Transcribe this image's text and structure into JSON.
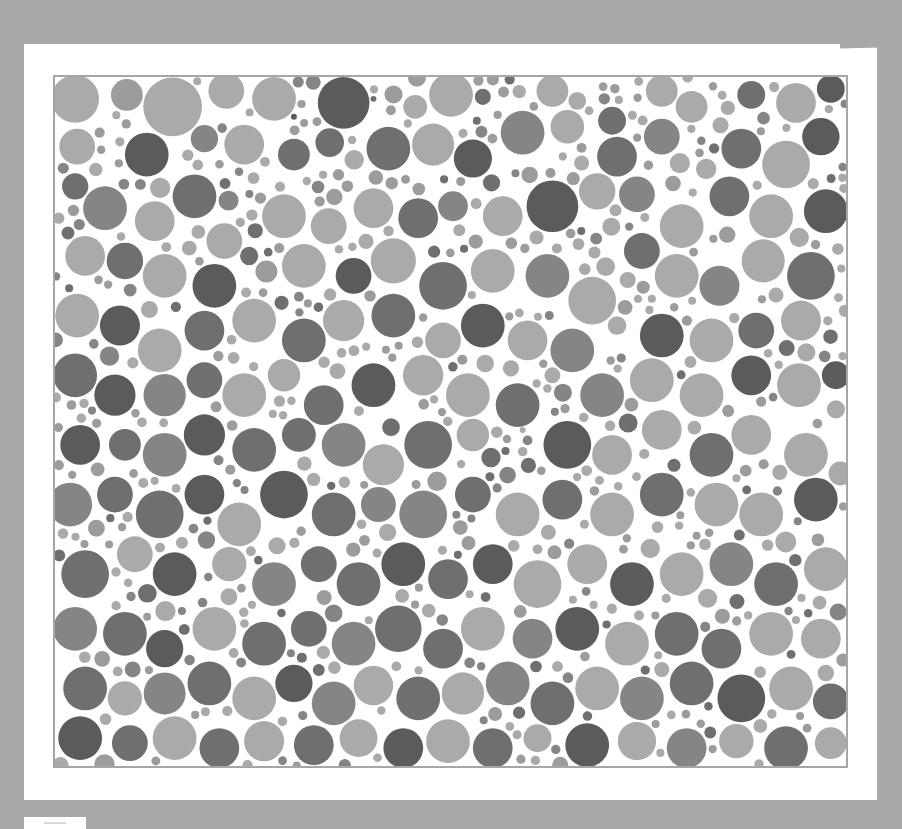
{
  "page": {
    "background_color": "#a9a9a9",
    "card_color": "#ffffff",
    "plate_border_color": "#a6a6a6"
  },
  "plate": {
    "type": "color-vision test plate (pseudo-isochromatic dot pattern, grayscale)",
    "hidden_figure_hint": "darker dot cluster in lower-left/center region",
    "palette": {
      "light": "#aaaaaa",
      "mid_light": "#9c9c9c",
      "mid": "#858585",
      "dark": "#6f6f6f",
      "darkest": "#5b5b5b"
    },
    "width": 795,
    "height": 693,
    "dots": [
      [
        20,
        22,
        24,
        "light"
      ],
      [
        72,
        18,
        16,
        "mid_light"
      ],
      [
        118,
        30,
        30,
        "light"
      ],
      [
        172,
        14,
        18,
        "light"
      ],
      [
        220,
        22,
        22,
        "light"
      ],
      [
        240,
        40,
        20,
        "darkest"
      ],
      [
        290,
        26,
        26,
        "darkest"
      ],
      [
        320,
        22,
        18,
        "dark"
      ],
      [
        362,
        30,
        12,
        "light"
      ],
      [
        398,
        18,
        22,
        "light"
      ],
      [
        430,
        20,
        16,
        "dark"
      ],
      [
        500,
        14,
        16,
        "light"
      ],
      [
        525,
        24,
        22,
        "light"
      ],
      [
        560,
        44,
        14,
        "dark"
      ],
      [
        610,
        14,
        16,
        "light"
      ],
      [
        640,
        30,
        26,
        "light"
      ],
      [
        700,
        18,
        14,
        "dark"
      ],
      [
        745,
        26,
        20,
        "light"
      ],
      [
        780,
        12,
        14,
        "darkest"
      ],
      [
        22,
        70,
        18,
        "light"
      ],
      [
        92,
        78,
        22,
        "darkest"
      ],
      [
        150,
        62,
        22,
        "mid"
      ],
      [
        190,
        68,
        20,
        "light"
      ],
      [
        240,
        78,
        16,
        "dark"
      ],
      [
        276,
        66,
        20,
        "dark"
      ],
      [
        335,
        72,
        22,
        "dark"
      ],
      [
        380,
        68,
        24,
        "light"
      ],
      [
        420,
        82,
        24,
        "darkest"
      ],
      [
        470,
        56,
        22,
        "mid"
      ],
      [
        515,
        50,
        22,
        "light"
      ],
      [
        565,
        80,
        20,
        "dark"
      ],
      [
        610,
        60,
        18,
        "mid"
      ],
      [
        690,
        72,
        20,
        "dark"
      ],
      [
        735,
        88,
        24,
        "light"
      ],
      [
        770,
        60,
        20,
        "darkest"
      ],
      [
        50,
        132,
        22,
        "mid"
      ],
      [
        20,
        110,
        16,
        "dark"
      ],
      [
        100,
        145,
        20,
        "light"
      ],
      [
        140,
        120,
        22,
        "dark"
      ],
      [
        170,
        165,
        18,
        "light"
      ],
      [
        230,
        140,
        22,
        "light"
      ],
      [
        275,
        150,
        18,
        "light"
      ],
      [
        320,
        132,
        20,
        "light"
      ],
      [
        365,
        142,
        20,
        "dark"
      ],
      [
        400,
        130,
        18,
        "mid"
      ],
      [
        450,
        140,
        20,
        "light"
      ],
      [
        500,
        130,
        26,
        "darkest"
      ],
      [
        545,
        115,
        22,
        "light"
      ],
      [
        585,
        118,
        18,
        "mid"
      ],
      [
        630,
        150,
        22,
        "light"
      ],
      [
        678,
        120,
        20,
        "dark"
      ],
      [
        720,
        140,
        22,
        "light"
      ],
      [
        775,
        135,
        22,
        "darkest"
      ],
      [
        30,
        180,
        20,
        "light"
      ],
      [
        70,
        185,
        20,
        "dark"
      ],
      [
        110,
        200,
        22,
        "light"
      ],
      [
        160,
        210,
        22,
        "darkest"
      ],
      [
        195,
        180,
        16,
        "dark"
      ],
      [
        250,
        190,
        22,
        "light"
      ],
      [
        300,
        200,
        18,
        "darkest"
      ],
      [
        340,
        185,
        24,
        "light"
      ],
      [
        390,
        210,
        24,
        "dark"
      ],
      [
        440,
        195,
        22,
        "light"
      ],
      [
        495,
        200,
        22,
        "mid"
      ],
      [
        540,
        225,
        24,
        "light"
      ],
      [
        590,
        175,
        18,
        "dark"
      ],
      [
        625,
        200,
        22,
        "light"
      ],
      [
        668,
        210,
        22,
        "mid"
      ],
      [
        712,
        185,
        22,
        "light"
      ],
      [
        760,
        200,
        24,
        "dark"
      ],
      [
        22,
        240,
        22,
        "light"
      ],
      [
        65,
        250,
        22,
        "darkest"
      ],
      [
        105,
        275,
        22,
        "light"
      ],
      [
        150,
        255,
        20,
        "dark"
      ],
      [
        200,
        245,
        22,
        "light"
      ],
      [
        250,
        265,
        22,
        "dark"
      ],
      [
        290,
        245,
        22,
        "light"
      ],
      [
        340,
        240,
        22,
        "dark"
      ],
      [
        390,
        265,
        18,
        "light"
      ],
      [
        430,
        250,
        22,
        "darkest"
      ],
      [
        475,
        265,
        20,
        "light"
      ],
      [
        520,
        275,
        22,
        "mid"
      ],
      [
        565,
        250,
        22,
        "light"
      ],
      [
        610,
        260,
        22,
        "darkest"
      ],
      [
        660,
        265,
        22,
        "light"
      ],
      [
        705,
        255,
        18,
        "dark"
      ],
      [
        750,
        245,
        24,
        "light"
      ],
      [
        20,
        300,
        22,
        "dark"
      ],
      [
        60,
        320,
        24,
        "darkest"
      ],
      [
        110,
        320,
        22,
        "mid"
      ],
      [
        150,
        305,
        18,
        "dark"
      ],
      [
        190,
        320,
        22,
        "light"
      ],
      [
        230,
        300,
        20,
        "light"
      ],
      [
        270,
        330,
        20,
        "dark"
      ],
      [
        320,
        310,
        22,
        "darkest"
      ],
      [
        370,
        300,
        22,
        "light"
      ],
      [
        415,
        320,
        22,
        "light"
      ],
      [
        465,
        330,
        22,
        "dark"
      ],
      [
        500,
        300,
        20,
        "light"
      ],
      [
        550,
        320,
        22,
        "mid"
      ],
      [
        600,
        305,
        22,
        "light"
      ],
      [
        650,
        320,
        22,
        "light"
      ],
      [
        700,
        300,
        20,
        "darkest"
      ],
      [
        748,
        310,
        22,
        "light"
      ],
      [
        785,
        300,
        14,
        "darkest"
      ],
      [
        25,
        370,
        20,
        "darkest"
      ],
      [
        70,
        370,
        16,
        "dark"
      ],
      [
        110,
        380,
        22,
        "mid"
      ],
      [
        150,
        360,
        24,
        "darkest"
      ],
      [
        200,
        375,
        22,
        "dark"
      ],
      [
        245,
        360,
        20,
        "dark"
      ],
      [
        290,
        370,
        22,
        "mid"
      ],
      [
        330,
        390,
        22,
        "light"
      ],
      [
        375,
        370,
        24,
        "dark"
      ],
      [
        420,
        360,
        20,
        "light"
      ],
      [
        470,
        355,
        22,
        "light"
      ],
      [
        515,
        370,
        24,
        "darkest"
      ],
      [
        560,
        380,
        20,
        "light"
      ],
      [
        610,
        355,
        20,
        "light"
      ],
      [
        660,
        380,
        22,
        "dark"
      ],
      [
        700,
        360,
        20,
        "light"
      ],
      [
        755,
        380,
        22,
        "light"
      ],
      [
        15,
        430,
        22,
        "mid"
      ],
      [
        60,
        420,
        18,
        "dark"
      ],
      [
        105,
        440,
        24,
        "dark"
      ],
      [
        150,
        420,
        20,
        "darkest"
      ],
      [
        185,
        450,
        22,
        "light"
      ],
      [
        230,
        420,
        24,
        "darkest"
      ],
      [
        280,
        440,
        22,
        "dark"
      ],
      [
        325,
        430,
        22,
        "mid"
      ],
      [
        370,
        440,
        24,
        "mid"
      ],
      [
        420,
        420,
        18,
        "dark"
      ],
      [
        465,
        440,
        22,
        "light"
      ],
      [
        510,
        425,
        20,
        "dark"
      ],
      [
        560,
        440,
        22,
        "light"
      ],
      [
        610,
        420,
        22,
        "dark"
      ],
      [
        665,
        430,
        22,
        "light"
      ],
      [
        710,
        440,
        22,
        "light"
      ],
      [
        765,
        425,
        22,
        "darkest"
      ],
      [
        30,
        500,
        24,
        "dark"
      ],
      [
        80,
        480,
        18,
        "light"
      ],
      [
        120,
        500,
        22,
        "darkest"
      ],
      [
        175,
        490,
        22,
        "light"
      ],
      [
        220,
        510,
        22,
        "mid"
      ],
      [
        265,
        490,
        18,
        "dark"
      ],
      [
        305,
        510,
        22,
        "dark"
      ],
      [
        350,
        490,
        22,
        "darkest"
      ],
      [
        395,
        505,
        20,
        "dark"
      ],
      [
        440,
        490,
        20,
        "darkest"
      ],
      [
        485,
        510,
        24,
        "light"
      ],
      [
        535,
        490,
        20,
        "light"
      ],
      [
        580,
        510,
        22,
        "darkest"
      ],
      [
        630,
        500,
        22,
        "light"
      ],
      [
        680,
        490,
        22,
        "mid"
      ],
      [
        725,
        510,
        22,
        "dark"
      ],
      [
        775,
        495,
        22,
        "light"
      ],
      [
        20,
        555,
        22,
        "mid"
      ],
      [
        70,
        560,
        22,
        "dark"
      ],
      [
        110,
        575,
        22,
        "darkest"
      ],
      [
        160,
        555,
        22,
        "light"
      ],
      [
        210,
        570,
        22,
        "dark"
      ],
      [
        255,
        555,
        18,
        "dark"
      ],
      [
        300,
        570,
        22,
        "mid"
      ],
      [
        345,
        555,
        24,
        "dark"
      ],
      [
        390,
        575,
        20,
        "dark"
      ],
      [
        430,
        555,
        22,
        "light"
      ],
      [
        480,
        565,
        20,
        "mid"
      ],
      [
        525,
        555,
        22,
        "darkest"
      ],
      [
        575,
        570,
        22,
        "light"
      ],
      [
        625,
        560,
        22,
        "dark"
      ],
      [
        670,
        575,
        20,
        "dark"
      ],
      [
        720,
        560,
        22,
        "light"
      ],
      [
        770,
        565,
        20,
        "light"
      ],
      [
        30,
        615,
        22,
        "dark"
      ],
      [
        70,
        625,
        18,
        "light"
      ],
      [
        110,
        620,
        22,
        "mid"
      ],
      [
        155,
        610,
        22,
        "dark"
      ],
      [
        200,
        625,
        22,
        "light"
      ],
      [
        240,
        610,
        20,
        "darkest"
      ],
      [
        280,
        630,
        22,
        "mid"
      ],
      [
        320,
        612,
        22,
        "light"
      ],
      [
        365,
        625,
        22,
        "dark"
      ],
      [
        410,
        620,
        22,
        "light"
      ],
      [
        455,
        610,
        22,
        "mid"
      ],
      [
        500,
        630,
        22,
        "dark"
      ],
      [
        545,
        615,
        22,
        "light"
      ],
      [
        590,
        625,
        22,
        "mid"
      ],
      [
        640,
        610,
        22,
        "dark"
      ],
      [
        690,
        625,
        24,
        "darkest"
      ],
      [
        740,
        615,
        22,
        "light"
      ],
      [
        780,
        628,
        18,
        "dark"
      ],
      [
        25,
        665,
        22,
        "darkest"
      ],
      [
        75,
        670,
        18,
        "dark"
      ],
      [
        120,
        665,
        22,
        "light"
      ],
      [
        165,
        675,
        20,
        "dark"
      ],
      [
        210,
        668,
        22,
        "light"
      ],
      [
        260,
        672,
        20,
        "dark"
      ],
      [
        305,
        665,
        22,
        "light"
      ],
      [
        350,
        675,
        20,
        "darkest"
      ],
      [
        395,
        668,
        22,
        "light"
      ],
      [
        440,
        675,
        20,
        "dark"
      ],
      [
        485,
        665,
        22,
        "light"
      ],
      [
        535,
        672,
        22,
        "darkest"
      ],
      [
        585,
        668,
        22,
        "light"
      ],
      [
        635,
        675,
        20,
        "mid"
      ],
      [
        685,
        668,
        22,
        "light"
      ],
      [
        735,
        675,
        22,
        "dark"
      ],
      [
        780,
        670,
        16,
        "light"
      ]
    ],
    "filler": {
      "seed": 20240517,
      "attempts": 4200,
      "min_radius": 4,
      "max_radius": 12,
      "gap": 2,
      "tones": [
        "light",
        "light",
        "light",
        "mid_light",
        "mid_light",
        "mid",
        "dark"
      ]
    }
  },
  "footer_tab": {
    "visible": true
  }
}
